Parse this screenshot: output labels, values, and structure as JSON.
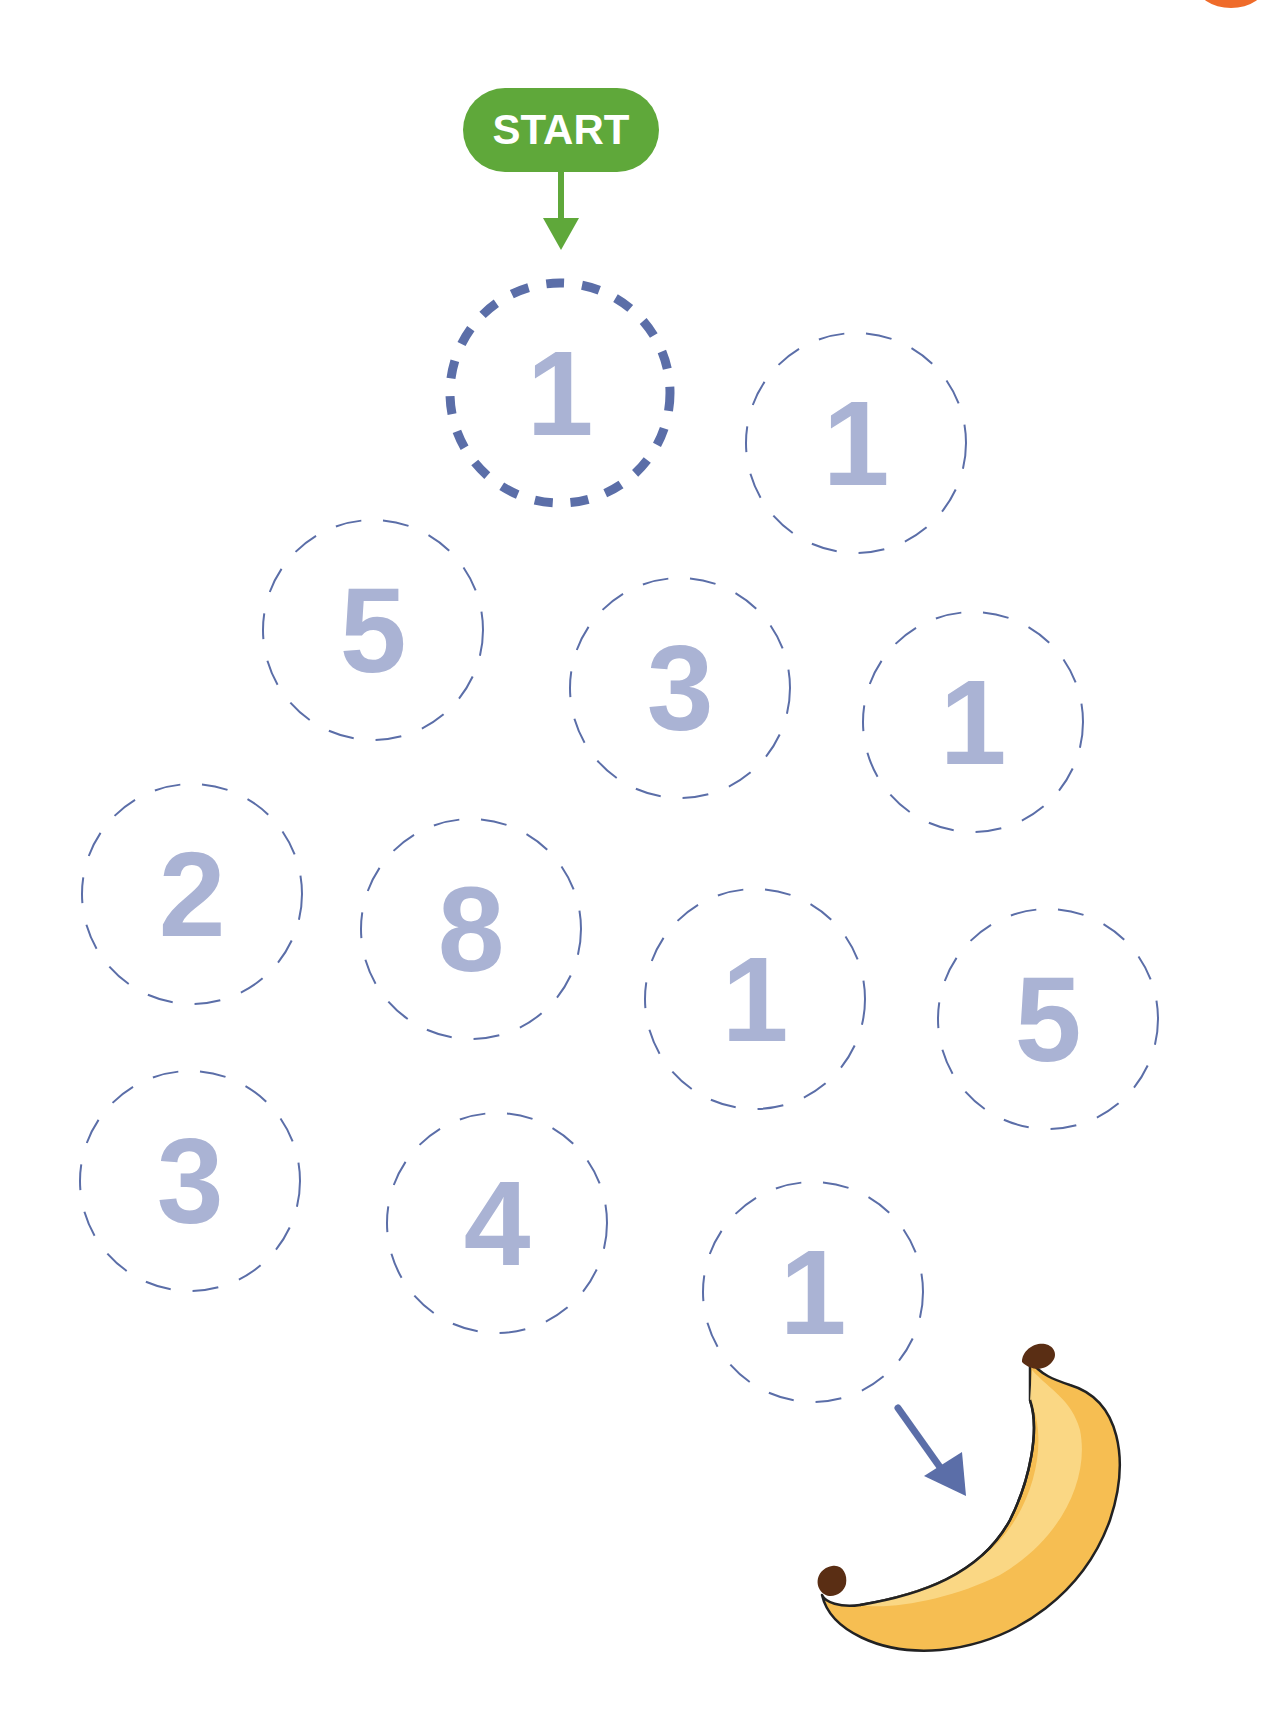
{
  "puzzle": {
    "start_label": "START",
    "colors": {
      "start_green": "#5fa83a",
      "path_blue": "#5b6ea8",
      "number_fill": "#aab3d4",
      "corner_orange": "#ef6b2a",
      "banana_light": "#fbd98a",
      "banana_dark": "#f6be52",
      "banana_tip": "#5a2e14"
    },
    "cells": [
      {
        "value": "1",
        "cx": 560,
        "cy": 393,
        "highlighted": true
      },
      {
        "value": "1",
        "cx": 856,
        "cy": 443,
        "highlighted": false
      },
      {
        "value": "5",
        "cx": 373,
        "cy": 630,
        "highlighted": false
      },
      {
        "value": "3",
        "cx": 680,
        "cy": 688,
        "highlighted": false
      },
      {
        "value": "1",
        "cx": 973,
        "cy": 722,
        "highlighted": false
      },
      {
        "value": "2",
        "cx": 192,
        "cy": 894,
        "highlighted": false
      },
      {
        "value": "8",
        "cx": 471,
        "cy": 929,
        "highlighted": false
      },
      {
        "value": "1",
        "cx": 755,
        "cy": 999,
        "highlighted": false
      },
      {
        "value": "5",
        "cx": 1048,
        "cy": 1019,
        "highlighted": false
      },
      {
        "value": "3",
        "cx": 190,
        "cy": 1181,
        "highlighted": false
      },
      {
        "value": "4",
        "cx": 497,
        "cy": 1223,
        "highlighted": false
      },
      {
        "value": "1",
        "cx": 813,
        "cy": 1292,
        "highlighted": false
      }
    ],
    "goal": {
      "name": "banana"
    }
  }
}
